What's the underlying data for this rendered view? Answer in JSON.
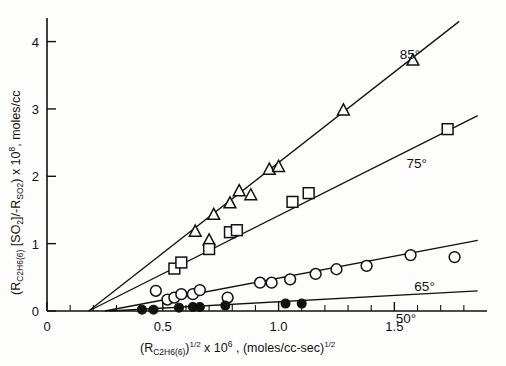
{
  "chart_data": {
    "type": "scatter",
    "title": "",
    "xlabel": "(R_C2H6(6))^1/2 x 10^6, (moles/cc-sec)^1/2",
    "ylabel": "(R_C2H6(6) [SO2]/-R_SO2) x 10^8, moles/cc",
    "xlim": [
      0,
      1.9
    ],
    "ylim": [
      0,
      4.35
    ],
    "xticks": [
      0,
      0.5,
      1.0,
      1.5
    ],
    "xticklabels": [
      "0",
      "0.5",
      "1.0",
      "1.5"
    ],
    "yticks": [
      0,
      1,
      2,
      3,
      4
    ],
    "yticklabels": [
      "0",
      "1",
      "2",
      "3",
      "4"
    ],
    "x_minor_step": 0.1,
    "grid": false,
    "legend_position": "inline-right",
    "series": [
      {
        "name": "85°",
        "label": "85°",
        "marker": "triangle-open",
        "fit_line": {
          "x0": 0.18,
          "y0": 0.0,
          "x1": 1.78,
          "y1": 4.3
        },
        "points": [
          {
            "x": 0.64,
            "y": 1.18
          },
          {
            "x": 0.7,
            "y": 1.05
          },
          {
            "x": 0.72,
            "y": 1.43
          },
          {
            "x": 0.79,
            "y": 1.6
          },
          {
            "x": 0.83,
            "y": 1.78
          },
          {
            "x": 0.88,
            "y": 1.72
          },
          {
            "x": 0.96,
            "y": 2.1
          },
          {
            "x": 1.0,
            "y": 2.14
          },
          {
            "x": 1.28,
            "y": 2.98
          },
          {
            "x": 1.58,
            "y": 3.72
          }
        ]
      },
      {
        "name": "75°",
        "label": "75°",
        "marker": "square-open",
        "fit_line": {
          "x0": 0.18,
          "y0": 0.0,
          "x1": 1.86,
          "y1": 2.9
        },
        "points": [
          {
            "x": 0.55,
            "y": 0.63
          },
          {
            "x": 0.58,
            "y": 0.72
          },
          {
            "x": 0.7,
            "y": 0.92
          },
          {
            "x": 0.79,
            "y": 1.17
          },
          {
            "x": 0.82,
            "y": 1.2
          },
          {
            "x": 1.06,
            "y": 1.62
          },
          {
            "x": 1.13,
            "y": 1.75
          },
          {
            "x": 1.73,
            "y": 2.7
          }
        ]
      },
      {
        "name": "65°",
        "label": "65°",
        "marker": "circle-open",
        "fit_line": {
          "x0": 0.25,
          "y0": 0.0,
          "x1": 1.86,
          "y1": 1.05
        },
        "points": [
          {
            "x": 0.47,
            "y": 0.3
          },
          {
            "x": 0.52,
            "y": 0.17
          },
          {
            "x": 0.55,
            "y": 0.2
          },
          {
            "x": 0.58,
            "y": 0.25
          },
          {
            "x": 0.63,
            "y": 0.25
          },
          {
            "x": 0.66,
            "y": 0.31
          },
          {
            "x": 0.78,
            "y": 0.2
          },
          {
            "x": 0.92,
            "y": 0.42
          },
          {
            "x": 0.97,
            "y": 0.42
          },
          {
            "x": 1.05,
            "y": 0.47
          },
          {
            "x": 1.16,
            "y": 0.55
          },
          {
            "x": 1.25,
            "y": 0.62
          },
          {
            "x": 1.38,
            "y": 0.67
          },
          {
            "x": 1.57,
            "y": 0.83
          },
          {
            "x": 1.76,
            "y": 0.8
          }
        ]
      },
      {
        "name": "50°",
        "label": "50°",
        "marker": "circle-filled",
        "fit_line": {
          "x0": 0.27,
          "y0": 0.0,
          "x1": 1.86,
          "y1": 0.3
        },
        "points": [
          {
            "x": 0.41,
            "y": 0.02
          },
          {
            "x": 0.46,
            "y": 0.02
          },
          {
            "x": 0.57,
            "y": 0.05
          },
          {
            "x": 0.63,
            "y": 0.06
          },
          {
            "x": 0.66,
            "y": 0.06
          },
          {
            "x": 0.77,
            "y": 0.08
          },
          {
            "x": 1.03,
            "y": 0.11
          },
          {
            "x": 1.1,
            "y": 0.11
          }
        ]
      }
    ]
  },
  "axis_titles": {
    "y_parts": {
      "open_paren": "(R",
      "y_sub1": "C",
      "y_sub2": "2",
      "y_sub3": "H",
      "y_sub4": "6",
      "y_sub5": "(6)",
      "bracket_open": " [SO",
      "so2_sub": "2",
      "bracket_close": "]/-R",
      "rso2_sub": "SO",
      "rso2_sub2": "2",
      "close_paren": ") x 10",
      "exp": "8",
      "tail": ", moles/cc"
    },
    "x_parts": {
      "open_paren": "(R",
      "x_sub1": "C",
      "x_sub2": "2",
      "x_sub3": "H",
      "x_sub4": "6",
      "x_sub5": "(6)",
      "close_paren": ")",
      "half1": "1/2",
      "times": " x 10",
      "exp6": "6",
      "comma": " , (moles/cc-sec)",
      "half2": "1/2"
    }
  }
}
